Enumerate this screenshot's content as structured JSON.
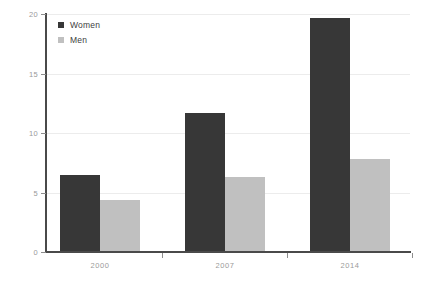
{
  "chart_data": {
    "type": "bar",
    "title": "",
    "subtitle": "",
    "xlabel": "",
    "ylabel": "",
    "categories": [
      "2000",
      "2007",
      "2014"
    ],
    "series": [
      {
        "name": "Women",
        "color": "#373737",
        "values": [
          6.5,
          11.7,
          19.7
        ]
      },
      {
        "name": "Men",
        "color": "#c0c0c0",
        "values": [
          4.4,
          6.3,
          7.8
        ]
      }
    ],
    "ylim": [
      0,
      20
    ],
    "yticks": [
      0,
      5,
      10,
      15,
      20
    ],
    "ytick_labels": [
      "0",
      "5",
      "10",
      "15",
      "20"
    ],
    "grid": true,
    "grid_axis": "y",
    "legend_position": "top-left-inside",
    "annotations": [],
    "background_color": "#ffffff",
    "axis_color": "#4a4a4a",
    "gridline_color": "#ececec",
    "tick_label_color": "#9a9a9a"
  },
  "legend": {
    "entries": [
      {
        "label": "Women",
        "swatch_color": "#373737"
      },
      {
        "label": "Men",
        "swatch_color": "#c0c0c0"
      }
    ]
  }
}
